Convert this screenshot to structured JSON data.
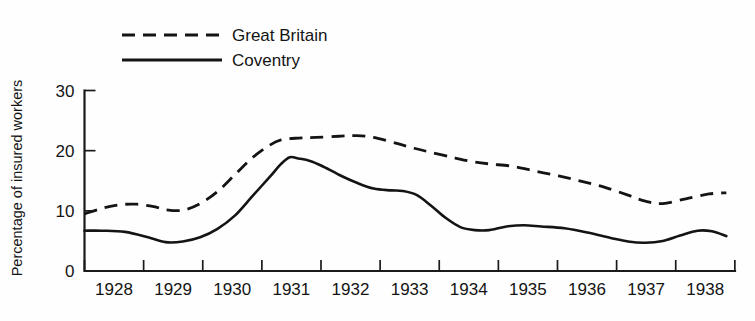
{
  "chart_data": {
    "type": "line",
    "title": "",
    "xlabel": "",
    "ylabel": "Percentage of insured workers",
    "xlim": [
      1927.6,
      1938.85
    ],
    "ylim": [
      0,
      30
    ],
    "grid": false,
    "legend_position": "top-left",
    "xticklabels": [
      "1928",
      "1929",
      "1930",
      "1931",
      "1932",
      "1933",
      "1934",
      "1935",
      "1936",
      "1937",
      "1938"
    ],
    "yticklabels": [
      "0",
      "10",
      "20",
      "30"
    ],
    "yticks": [
      0,
      10,
      20,
      30
    ],
    "series": [
      {
        "name": "Great Britain",
        "style": "dashed",
        "color": "#141414",
        "x": [
          1927.6,
          1927.9,
          1928.2,
          1928.5,
          1928.8,
          1929.0,
          1929.3,
          1929.6,
          1929.9,
          1930.2,
          1930.5,
          1930.8,
          1931.0,
          1931.3,
          1931.6,
          1932.0,
          1932.3,
          1932.6,
          1933.0,
          1933.3,
          1933.6,
          1934.0,
          1934.3,
          1934.6,
          1935.0,
          1935.4,
          1935.8,
          1936.2,
          1936.6,
          1937.0,
          1937.3,
          1937.6,
          1938.0,
          1938.4,
          1938.7
        ],
        "y": [
          9.5,
          10.4,
          11.0,
          11.1,
          10.7,
          10.2,
          10.1,
          11.2,
          13.2,
          16.0,
          18.8,
          20.9,
          21.8,
          22.1,
          22.2,
          22.4,
          22.5,
          22.2,
          21.2,
          20.4,
          19.7,
          18.8,
          18.2,
          17.8,
          17.4,
          16.6,
          15.8,
          14.9,
          13.9,
          12.6,
          11.6,
          11.2,
          12.0,
          12.8,
          13.0
        ]
      },
      {
        "name": "Coventry",
        "style": "solid",
        "color": "#141414",
        "x": [
          1927.6,
          1927.9,
          1928.3,
          1928.7,
          1929.0,
          1929.3,
          1929.6,
          1929.9,
          1930.2,
          1930.5,
          1930.8,
          1931.0,
          1931.15,
          1931.3,
          1931.5,
          1931.7,
          1932.0,
          1932.3,
          1932.6,
          1932.9,
          1933.1,
          1933.35,
          1933.6,
          1933.85,
          1934.1,
          1934.35,
          1934.6,
          1934.9,
          1935.2,
          1935.5,
          1935.9,
          1936.3,
          1936.7,
          1937.0,
          1937.3,
          1937.6,
          1937.9,
          1938.2,
          1938.45,
          1938.7
        ],
        "y": [
          6.7,
          6.7,
          6.5,
          5.6,
          4.8,
          4.9,
          5.6,
          7.0,
          9.2,
          12.4,
          15.6,
          17.8,
          18.9,
          18.7,
          18.3,
          17.5,
          16.0,
          14.7,
          13.7,
          13.4,
          13.3,
          12.6,
          10.8,
          8.8,
          7.3,
          6.8,
          6.8,
          7.4,
          7.6,
          7.4,
          7.1,
          6.4,
          5.5,
          4.9,
          4.7,
          5.0,
          5.9,
          6.7,
          6.6,
          5.8
        ]
      }
    ]
  },
  "legend": {
    "items": [
      {
        "label": "Great Britain",
        "style": "dashed"
      },
      {
        "label": "Coventry",
        "style": "solid"
      }
    ]
  }
}
